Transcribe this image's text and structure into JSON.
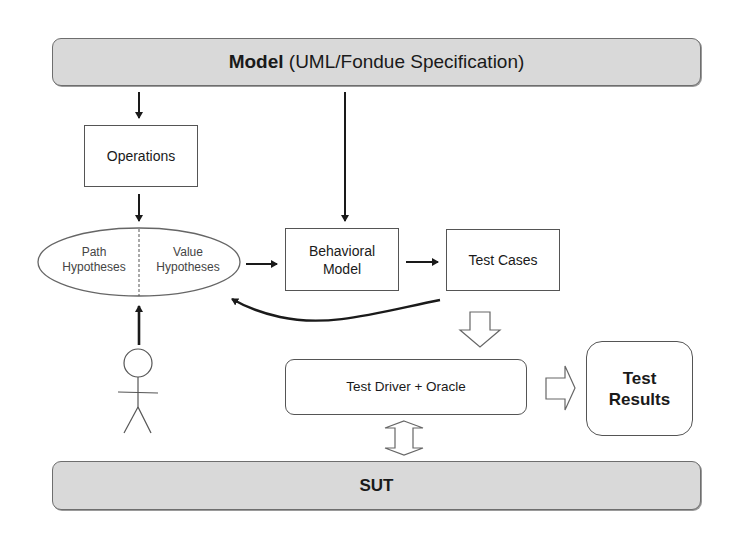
{
  "diagram": {
    "model": {
      "label_bold": "Model",
      "label_rest": " (UML/Fondue Specification)"
    },
    "operations": {
      "label": "Operations"
    },
    "hypotheses": {
      "path": {
        "line1": "Path",
        "line2": "Hypotheses"
      },
      "value": {
        "line1": "Value",
        "line2": "Hypotheses"
      }
    },
    "behavioral_model": {
      "line1": "Behavioral",
      "line2": "Model"
    },
    "test_cases": {
      "label": "Test Cases"
    },
    "test_driver": {
      "label": "Test Driver + Oracle"
    },
    "test_results": {
      "line1": "Test",
      "line2": "Results"
    },
    "sut": {
      "label": "SUT"
    },
    "actor": {
      "icon": "stick-figure-user"
    },
    "colors": {
      "bar_fill": "#d9d9d9",
      "bar_border": "#6e6e6e",
      "box_border": "#555555",
      "arrow": "#1a1a1a"
    },
    "edges": [
      {
        "from": "model",
        "to": "operations",
        "type": "arrow"
      },
      {
        "from": "model",
        "to": "behavioral_model",
        "type": "arrow"
      },
      {
        "from": "operations",
        "to": "hypotheses",
        "type": "arrow"
      },
      {
        "from": "actor",
        "to": "hypotheses",
        "type": "arrow"
      },
      {
        "from": "hypotheses",
        "to": "behavioral_model",
        "type": "arrow"
      },
      {
        "from": "behavioral_model",
        "to": "test_cases",
        "type": "arrow"
      },
      {
        "from": "test_cases",
        "to": "hypotheses",
        "type": "curved-arrow"
      },
      {
        "from": "test_cases",
        "to": "test_driver",
        "type": "hollow-arrow"
      },
      {
        "from": "test_driver",
        "to": "test_results",
        "type": "hollow-arrow"
      },
      {
        "from": "test_driver",
        "to": "sut",
        "type": "hollow-double-arrow"
      }
    ]
  }
}
